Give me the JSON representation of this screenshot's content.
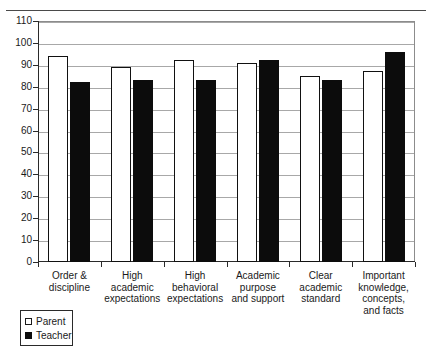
{
  "figure": {
    "caption_fragment": "",
    "legend_box": {
      "entries": [
        {
          "label": "Parent",
          "swatch": "white-square",
          "color": "#ffffff"
        },
        {
          "label": "Teacher",
          "swatch": "black-square",
          "color": "#0c0c0c"
        }
      ]
    }
  },
  "chart_data": {
    "type": "bar",
    "title": "",
    "xlabel": "",
    "ylabel": "",
    "ylim": [
      0,
      110
    ],
    "ytick_step": 10,
    "yticks": [
      0,
      10,
      20,
      30,
      40,
      50,
      60,
      70,
      80,
      90,
      100,
      110
    ],
    "grid": true,
    "legend_position": "below-left",
    "categories": [
      "Order & discipline",
      "High academic expectations",
      "High behavioral expectations",
      "Academic purpose and support",
      "Clear academic standard",
      "Important knowledge, concepts, and facts"
    ],
    "category_lines": [
      [
        "Order &",
        "discipline"
      ],
      [
        "High",
        "academic",
        "expectations"
      ],
      [
        "High",
        "behavioral",
        "expectations"
      ],
      [
        "Academic",
        "purpose",
        "and support"
      ],
      [
        "Clear",
        "academic",
        "standard"
      ],
      [
        "Important",
        "knowledge,",
        "concepts,",
        "and facts"
      ]
    ],
    "series": [
      {
        "name": "Parent",
        "color": "#ffffff",
        "values": [
          94,
          89,
          92,
          91,
          85,
          87
        ]
      },
      {
        "name": "Teacher",
        "color": "#0c0c0c",
        "values": [
          82,
          83,
          83,
          92,
          83,
          96
        ]
      }
    ]
  }
}
